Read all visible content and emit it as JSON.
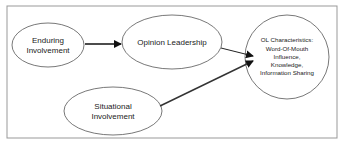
{
  "diagram": {
    "nodes": [
      {
        "id": "enduring",
        "lines": [
          "Enduring",
          "Involvement"
        ]
      },
      {
        "id": "opinion",
        "lines": [
          "Opinion Leadership"
        ]
      },
      {
        "id": "ol",
        "lines": [
          "OL Characteristics:",
          "Word-Of-Mouth",
          "Influence,",
          "Knowledge,",
          "Information Sharing"
        ]
      },
      {
        "id": "situational",
        "lines": [
          "Situational",
          "Involvement"
        ]
      }
    ],
    "edges": [
      {
        "from": "enduring",
        "to": "opinion"
      },
      {
        "from": "opinion",
        "to": "ol"
      },
      {
        "from": "situational",
        "to": "ol"
      }
    ],
    "colors": {
      "stroke": "#555555",
      "arrow": "#111111",
      "background": "#ffffff",
      "frame": "#999999"
    }
  }
}
